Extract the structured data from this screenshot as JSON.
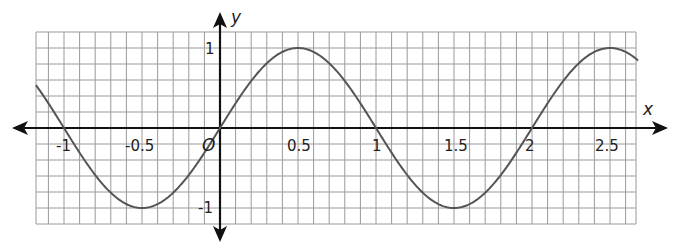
{
  "chart_data": {
    "type": "line",
    "title": "",
    "xlabel": "x",
    "ylabel": "y",
    "origin_label": "O",
    "function_description": "y = sin(pi * x)",
    "xlim": [
      -1.18,
      2.68
    ],
    "ylim": [
      -1.2,
      1.2
    ],
    "grid": true,
    "grid_minor_x_step": 0.1,
    "grid_minor_y_step": 0.2,
    "x_ticks": [
      {
        "value": -1,
        "label": "-1"
      },
      {
        "value": -0.5,
        "label": "-0.5"
      },
      {
        "value": 0.5,
        "label": "0.5"
      },
      {
        "value": 1,
        "label": "1"
      },
      {
        "value": 1.5,
        "label": "1.5"
      },
      {
        "value": 2,
        "label": "2"
      },
      {
        "value": 2.5,
        "label": "2.5"
      }
    ],
    "y_ticks": [
      {
        "value": 1,
        "label": "1"
      },
      {
        "value": -1,
        "label": "-1"
      }
    ],
    "series": [
      {
        "name": "curve",
        "color": "#555555",
        "x": [
          -1.18,
          -1,
          -0.75,
          -0.5,
          -0.25,
          0,
          0.25,
          0.5,
          0.75,
          1,
          1.25,
          1.5,
          1.75,
          2,
          2.25,
          2.5,
          2.68
        ],
        "y": [
          0.54,
          0,
          -0.71,
          -1,
          -0.71,
          0,
          0.71,
          1,
          0.71,
          0,
          -0.71,
          -1,
          -0.71,
          0,
          0.71,
          1,
          0.84
        ]
      }
    ],
    "key_points": {
      "zeros": [
        -1,
        0,
        1,
        2
      ],
      "maxima": [
        [
          0.5,
          1
        ],
        [
          2.5,
          1
        ]
      ],
      "minima": [
        [
          -0.5,
          -1
        ],
        [
          1.5,
          -1
        ]
      ]
    }
  },
  "labels": {
    "x_axis": "x",
    "y_axis": "y",
    "origin": "O",
    "x_ticks": [
      "-1",
      "-0.5",
      "0.5",
      "1",
      "1.5",
      "2",
      "2.5"
    ],
    "y_ticks": [
      "1",
      "-1"
    ]
  }
}
